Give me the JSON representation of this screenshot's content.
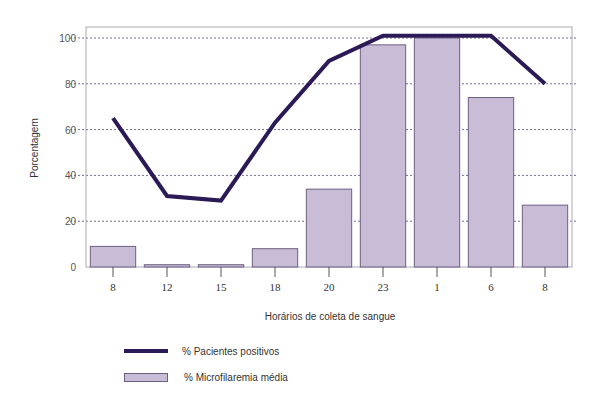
{
  "chart_data": {
    "type": "bar",
    "title": "",
    "xlabel": "Horários de coleta de sangue",
    "ylabel": "Porcentagem",
    "ylim": [
      0,
      100
    ],
    "yticks": [
      0,
      20,
      40,
      60,
      80,
      100
    ],
    "grid": true,
    "legend_position": "bottom-left",
    "categories": [
      "8",
      "12",
      "15",
      "18",
      "20",
      "23",
      "1",
      "6",
      "8"
    ],
    "series": [
      {
        "name": "% Pacientes positivos",
        "type": "line",
        "values": [
          65,
          31,
          29,
          63,
          90,
          101,
          101,
          101,
          80
        ],
        "color": "#2b1a55"
      },
      {
        "name": "% Microfilaremia média",
        "type": "bar",
        "values": [
          9,
          1,
          1,
          8,
          34,
          97,
          100,
          74,
          27
        ],
        "color": "#c8bcd6"
      }
    ]
  },
  "legend": {
    "line_label": "% Pacientes positivos",
    "bar_label": "% Microfilaremia média"
  },
  "colors": {
    "line": "#2b1a55",
    "bar_fill": "#c8bcd6",
    "bar_stroke": "#6d5f80",
    "grid": "#4a4a8a",
    "axis": "#8a8a9a"
  }
}
